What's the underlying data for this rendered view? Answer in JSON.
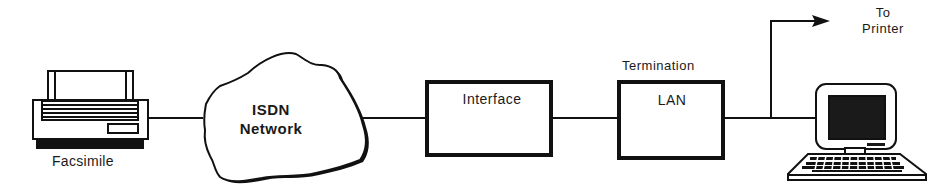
{
  "diagram": {
    "type": "network-block-diagram",
    "nodes": [
      {
        "id": "facsimile",
        "label": "Facsimile",
        "shape": "fax-machine-icon"
      },
      {
        "id": "isdn",
        "label_line1": "ISDN",
        "label_line2": "Network",
        "shape": "cloud"
      },
      {
        "id": "interface",
        "label": "Interface",
        "shape": "box"
      },
      {
        "id": "lan",
        "label": "LAN",
        "caption": "Termination",
        "shape": "box"
      },
      {
        "id": "computer",
        "label": "",
        "shape": "computer-icon"
      },
      {
        "id": "printer",
        "label_line1": "To",
        "label_line2": "Printer",
        "shape": "arrow-target"
      }
    ],
    "edges": [
      {
        "from": "facsimile",
        "to": "isdn"
      },
      {
        "from": "isdn",
        "to": "interface"
      },
      {
        "from": "interface",
        "to": "lan"
      },
      {
        "from": "lan",
        "to": "computer"
      },
      {
        "from": "lan",
        "to": "printer",
        "arrow": true
      }
    ],
    "colors": {
      "stroke": "#111111",
      "background": "#ffffff",
      "screen": "#1a1a1a"
    }
  }
}
